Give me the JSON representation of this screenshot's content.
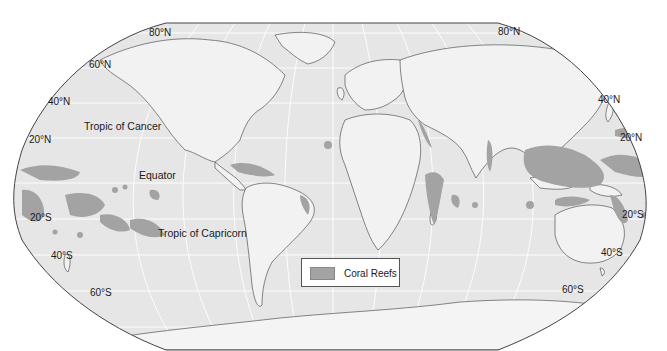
{
  "map": {
    "title": "Coral Reefs of the World",
    "projection": "Robinson",
    "colors": {
      "ocean": "#e6e6e6",
      "land": "#f2f2f2",
      "reef": "#a3a3a3",
      "border": "#555555",
      "graticule": "#ffffff",
      "antarctica": "#f4f4f4"
    },
    "latitude_labels_left": [
      "80°N",
      "60°N",
      "40°N",
      "20°N",
      "20°S",
      "40°S",
      "60°S"
    ],
    "latitude_labels_right": [
      "80°N",
      "40°N",
      "20°N",
      "20°S",
      "40°S",
      "60°S"
    ],
    "reference_lines": {
      "tropic_cancer": "Tropic of Cancer",
      "equator": "Equator",
      "tropic_capricorn": "Tropic of Capricorn"
    },
    "legend": {
      "items": [
        {
          "label": "Coral Reefs",
          "color": "#a3a3a3"
        }
      ]
    }
  }
}
